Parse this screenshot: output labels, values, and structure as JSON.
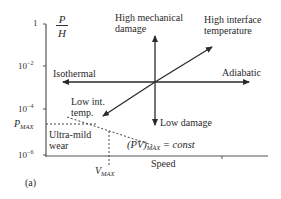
{
  "diagram": {
    "panel_label": "(a)",
    "y_axis": {
      "label_num": "P",
      "label_den": "H",
      "ticks": [
        {
          "base": "1",
          "exp": ""
        },
        {
          "base": "10",
          "exp": "−2"
        },
        {
          "base": "10",
          "exp": "−4"
        },
        {
          "base": "10",
          "exp": "−6"
        }
      ],
      "p_max_label": "P",
      "p_max_sub": "MAX"
    },
    "x_axis": {
      "label": "Speed",
      "v_max_label": "V",
      "v_max_sub": "MAX"
    },
    "arrows": {
      "up": "High mechanical damage",
      "up_line1": "High mechanical",
      "up_line2": "damage",
      "down": "Low damage",
      "left": "Isothermal",
      "right": "Adiabatic",
      "upper_right_line1": "High interface",
      "upper_right_line2": "temperature",
      "lower_left_line1": "Low int.",
      "lower_left_line2": "temp."
    },
    "region": {
      "line1": "Ultra-mild",
      "line2": "wear"
    },
    "equation": {
      "lhs": "(PV)",
      "sub": "MAX",
      "rhs": "= const"
    }
  }
}
